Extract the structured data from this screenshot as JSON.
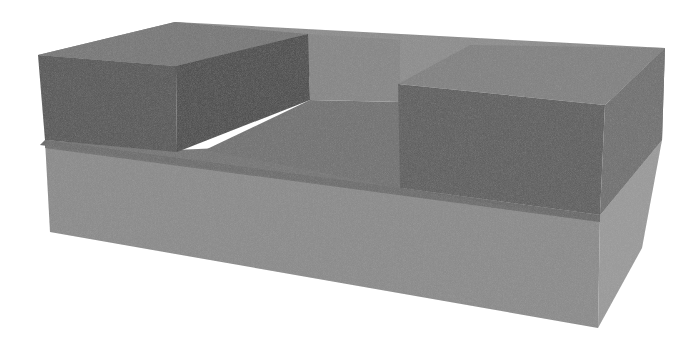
{
  "figure": {
    "layers": [
      {
        "id": "base-slab",
        "label": "base slab",
        "color_front": "#8a8a8a",
        "color_side": "#9a9a9a",
        "color_top": "#7c7c7c"
      },
      {
        "id": "middle-layer",
        "label": "translucent middle layer",
        "color_front": "#666666",
        "color_side": "#7e7e7e",
        "color_top": "#8c8c8c"
      },
      {
        "id": "left-block",
        "label": "left raised block",
        "color_front": "#545454",
        "color_side": "#4a4a4a",
        "color_top": "#767676"
      },
      {
        "id": "right-block",
        "label": "right raised block",
        "color_front": "#5c5c5c",
        "color_side": "#6e6e6e",
        "color_top": "#808080"
      }
    ],
    "background": "#ffffff"
  }
}
